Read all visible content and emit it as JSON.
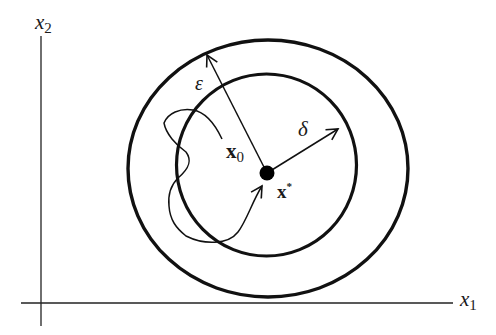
{
  "diagram": {
    "axes": {
      "x_label": {
        "base": "x",
        "subscript": "1"
      },
      "y_label": {
        "base": "x",
        "subscript": "2"
      }
    },
    "equilibrium": {
      "label_base": "x",
      "label_sup": "*"
    },
    "initial_state": {
      "label_base": "x",
      "label_sub": "0"
    },
    "outer_radius_label": "ε",
    "inner_radius_label": "δ",
    "colors": {
      "stroke": "#111111",
      "background": "#ffffff"
    }
  }
}
